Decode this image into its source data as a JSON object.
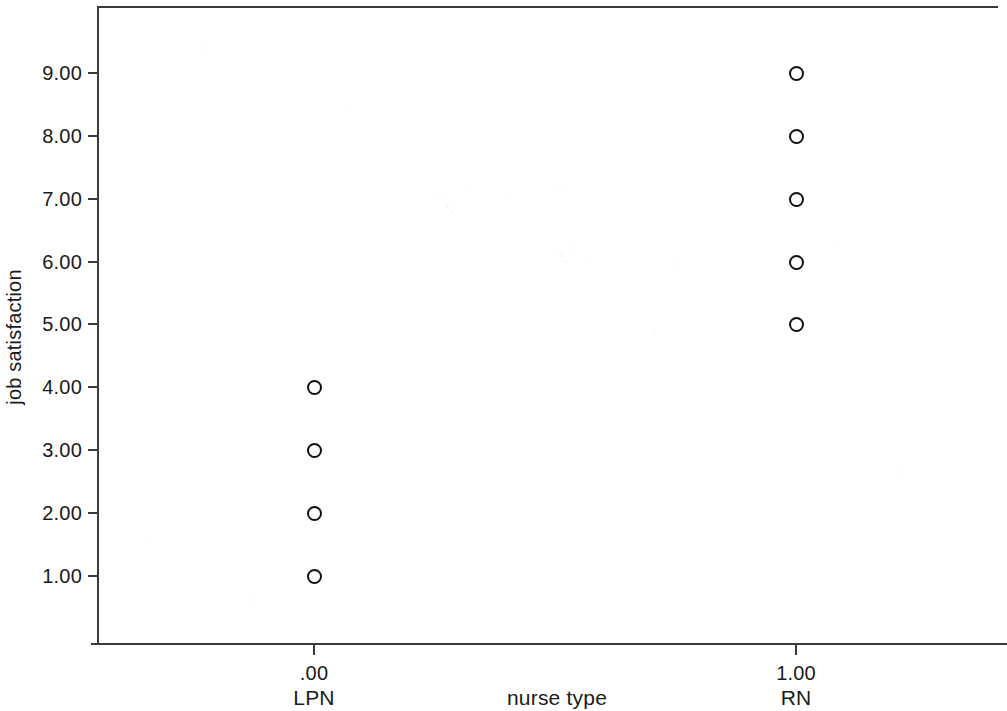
{
  "chart_data": {
    "type": "scatter",
    "title": "",
    "xlabel": "nurse type",
    "ylabel": "job satisfaction",
    "grid": false,
    "legend": "none",
    "x_tick_values": [
      ".00",
      "1.00"
    ],
    "x_category_labels": [
      "LPN",
      "RN"
    ],
    "y_tick_labels": [
      "9.00",
      "8.00",
      "7.00",
      "6.00",
      "5.00",
      "4.00",
      "3.00",
      "2.00",
      "1.00"
    ],
    "y_tick_values": [
      9,
      8,
      7,
      6,
      5,
      4,
      3,
      2,
      1
    ],
    "ylim": [
      0.3,
      9.9
    ],
    "xlim": [
      -0.45,
      1.45
    ],
    "groups": [
      {
        "x": 0,
        "x_label": ".00",
        "name": "LPN",
        "values": [
          4,
          3,
          2,
          1
        ]
      },
      {
        "x": 1,
        "x_label": "1.00",
        "name": "RN",
        "values": [
          9,
          8,
          7,
          6,
          5
        ]
      }
    ],
    "points": [
      {
        "x": 0,
        "y": 4,
        "group": "LPN"
      },
      {
        "x": 0,
        "y": 3,
        "group": "LPN"
      },
      {
        "x": 0,
        "y": 2,
        "group": "LPN"
      },
      {
        "x": 0,
        "y": 1,
        "group": "LPN"
      },
      {
        "x": 1,
        "y": 9,
        "group": "RN"
      },
      {
        "x": 1,
        "y": 8,
        "group": "RN"
      },
      {
        "x": 1,
        "y": 7,
        "group": "RN"
      },
      {
        "x": 1,
        "y": 6,
        "group": "RN"
      },
      {
        "x": 1,
        "y": 5,
        "group": "RN"
      }
    ],
    "marker": {
      "shape": "circle-open",
      "edge_color": "#111111",
      "fill": "none",
      "size_px": 14
    },
    "colors": {
      "axis": "#3a3a3a",
      "text": "#1a1a1a",
      "background": "#ffffff"
    }
  },
  "layout": {
    "plot_left_px": 97,
    "plot_top_px": 6,
    "plot_right_px": 998,
    "plot_bottom_px": 644,
    "y_pixel_per_unit": 62.9,
    "y_baseline_value": 1,
    "y_baseline_px": 576,
    "x_positions_px": [
      314,
      796
    ]
  }
}
